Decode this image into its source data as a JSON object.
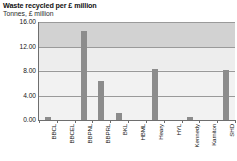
{
  "chart_data": {
    "type": "bar",
    "title": "Waste recycled per £ million",
    "subtitle": "Tonnes, £ million",
    "xlabel": "",
    "ylabel": "",
    "ylim": [
      0,
      16
    ],
    "yticks": [
      "0.00",
      "4.00",
      "8.00",
      "12.00",
      "16.00"
    ],
    "ytick_values": [
      0,
      4,
      8,
      12,
      16
    ],
    "grid": true,
    "legend": "none",
    "bar_color": "#8c8c8c",
    "plot_background": "#f2f2f2",
    "categories": [
      "BBCL",
      "BBCEL",
      "BBPNL",
      "BBPRL",
      "BKL",
      "HBML",
      "Heary",
      "HYL",
      "Kennedy",
      "Karniton",
      "SHD"
    ],
    "values": [
      0.5,
      0.0,
      14.5,
      6.4,
      1.2,
      0.0,
      8.3,
      0.0,
      0.5,
      0.0,
      8.2
    ]
  }
}
